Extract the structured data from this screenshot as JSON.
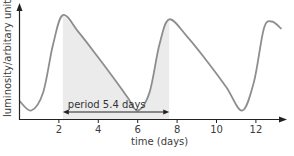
{
  "chart_data": {
    "type": "line",
    "title": "",
    "xlabel": "time (days)",
    "ylabel": "luminosity/arbitary units",
    "x_ticks": [
      "2",
      "4",
      "6",
      "8",
      "10",
      "12"
    ],
    "x_tick_values": [
      2,
      4,
      6,
      8,
      10,
      12
    ],
    "xlim": [
      0,
      13.5
    ],
    "ylim": [
      0,
      1
    ],
    "grid": false,
    "legend": null,
    "series": [
      {
        "name": "luminosity",
        "color": "#8c8c8c",
        "x": [
          0,
          0.6,
          1.2,
          1.7,
          2.2,
          3.0,
          4.0,
          5.0,
          5.5,
          6.0,
          6.6,
          7.1,
          7.6,
          8.5,
          9.5,
          10.5,
          11.3,
          11.9,
          12.4,
          12.8,
          13.3
        ],
        "y": [
          0.17,
          0.08,
          0.25,
          0.7,
          0.98,
          0.82,
          0.58,
          0.33,
          0.2,
          0.08,
          0.25,
          0.7,
          0.94,
          0.78,
          0.55,
          0.3,
          0.08,
          0.35,
          0.85,
          0.92,
          0.85
        ]
      }
    ],
    "shaded_region": {
      "x_start": 2.2,
      "x_end": 7.6,
      "color": "#ebebeb"
    },
    "annotations": [
      {
        "text": "period 5.4 days",
        "type": "double-arrow",
        "x_start": 2.2,
        "x_end": 7.6
      }
    ]
  }
}
